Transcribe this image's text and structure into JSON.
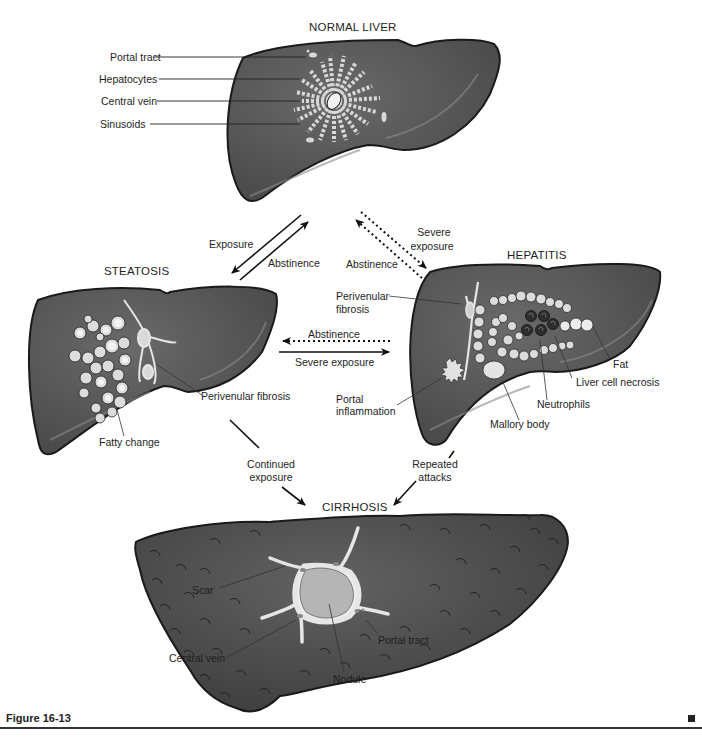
{
  "diagram": {
    "type": "flow",
    "nodes": {
      "normal": {
        "title": "NORMAL LIVER",
        "labels": [
          "Portal tract",
          "Hepatocytes",
          "Central vein",
          "Sinusoids"
        ]
      },
      "steatosis": {
        "title": "STEATOSIS",
        "labels": [
          "Perivenular fibrosis",
          "Fatty change"
        ]
      },
      "hepatitis": {
        "title": "HEPATITIS",
        "labels": {
          "perivenular_1": "Perivenular",
          "perivenular_2": "fibrosis",
          "portal_1": "Portal",
          "portal_2": "inflammation",
          "mallory": "Mallory body",
          "neutrophils": "Neutrophils",
          "necrosis": "Liver cell necrosis",
          "fat": "Fat"
        }
      },
      "cirrhosis": {
        "title": "CIRRHOSIS",
        "labels": {
          "scar": "Scar",
          "central_vein": "Central vein",
          "nodule": "Nodule",
          "portal_tract": "Portal tract"
        }
      }
    },
    "edges": {
      "normal_to_steatosis": "Exposure",
      "steatosis_to_normal": "Abstinence",
      "normal_to_hepatitis_1": "Severe",
      "normal_to_hepatitis_2": "exposure",
      "hepatitis_to_normal": "Abstinence",
      "hepatitis_to_steatosis": "Abstinence",
      "steatosis_to_hepatitis": "Severe exposure",
      "steatosis_to_cirrhosis_1": "Continued",
      "steatosis_to_cirrhosis_2": "exposure",
      "hepatitis_to_cirrhosis_1": "Repeated",
      "hepatitis_to_cirrhosis_2": "attacks"
    }
  },
  "figure": {
    "caption": "Figure 16-13"
  },
  "colors": {
    "liver_fill": "#555555",
    "liver_outline": "#1a1a1a",
    "cell_fill": "#d9d9d9",
    "scar_fill": "#e6e6e6",
    "nodule_fill": "#b5b5b5",
    "text": "#1e1e1e"
  }
}
